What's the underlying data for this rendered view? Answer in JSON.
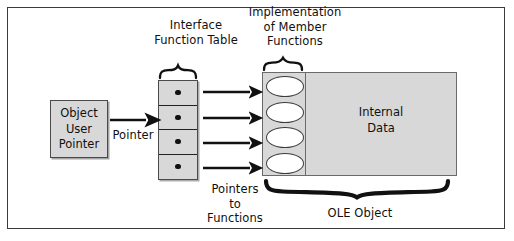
{
  "diagram": {
    "title_region": {
      "interface_function_table": "Interface\nFunction Table",
      "implementation_of_member_functions": "Implementation\nof Member\nFunctions"
    },
    "object_user_pointer": {
      "line1": "Object",
      "line2": "User",
      "line3": "Pointer"
    },
    "pointer_arrow_label": "Pointer",
    "pointers_to_functions_label": "Pointers\nto\nFunctions",
    "internal_data": {
      "line1": "Internal",
      "line2": "Data"
    },
    "ole_object_label": "OLE Object",
    "interface_function_table": {
      "slot_count": 4,
      "slot_marker": "filled-dot",
      "slots": [
        {
          "index": 1,
          "marker": "•"
        },
        {
          "index": 2,
          "marker": "•"
        },
        {
          "index": 3,
          "marker": "•"
        },
        {
          "index": 4,
          "marker": "•"
        }
      ]
    },
    "member_functions": {
      "count": 4,
      "shape": "ellipse",
      "items": [
        {
          "index": 1
        },
        {
          "index": 2
        },
        {
          "index": 3
        },
        {
          "index": 4
        }
      ]
    },
    "arrows": {
      "pointer_arrow_count": 1,
      "function_arrow_count": 4
    },
    "colors": {
      "frame_border": "#3a3a3a",
      "box_fill_gray": "#d8d8d8",
      "box_border": "#4a4a4a",
      "ellipse_fill": "#ffffff",
      "ellipse_border": "#3c3c3c",
      "arrow": "#111111",
      "text": "#101010",
      "background": "#ffffff"
    }
  }
}
